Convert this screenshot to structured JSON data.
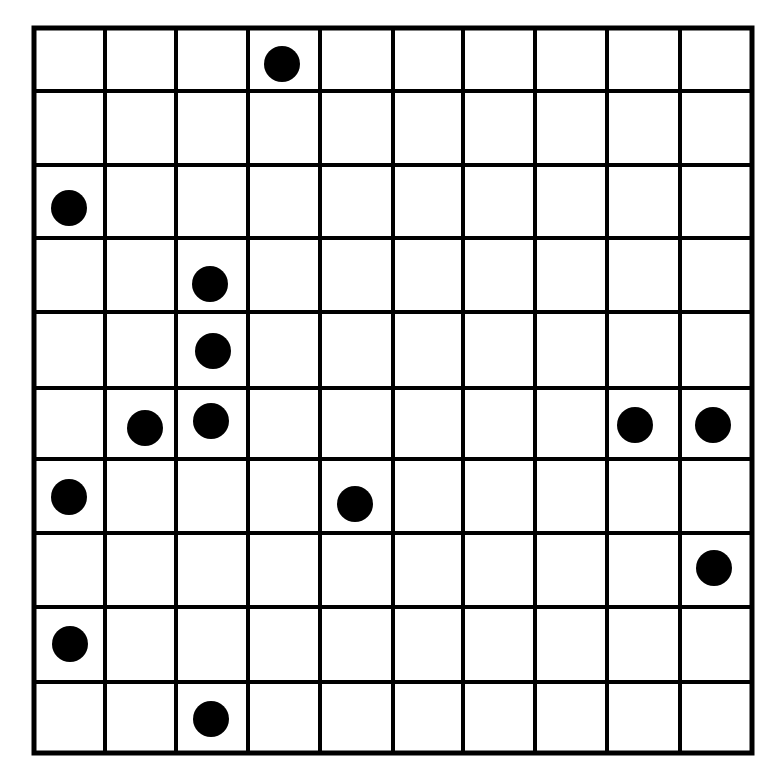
{
  "grid": {
    "rows": 10,
    "cols": 10,
    "x_lines": [
      34,
      105,
      176,
      248,
      320,
      393,
      463,
      535,
      607,
      680,
      752
    ],
    "y_lines": [
      28,
      91,
      165,
      238,
      312,
      388,
      459,
      533,
      607,
      682,
      753
    ],
    "line_color": "#000000",
    "background": "#ffffff",
    "line_width": 4,
    "outer_width": 5
  },
  "dots": {
    "color": "#000000",
    "radius": 18,
    "items": [
      {
        "row": 0,
        "col": 3,
        "x": 282,
        "y": 64
      },
      {
        "row": 2,
        "col": 0,
        "x": 69,
        "y": 208
      },
      {
        "row": 3,
        "col": 2,
        "x": 210,
        "y": 284
      },
      {
        "row": 4,
        "col": 2,
        "x": 213,
        "y": 351
      },
      {
        "row": 5,
        "col": 1,
        "x": 145,
        "y": 428
      },
      {
        "row": 5,
        "col": 2,
        "x": 211,
        "y": 421
      },
      {
        "row": 5,
        "col": 8,
        "x": 635,
        "y": 425
      },
      {
        "row": 5,
        "col": 9,
        "x": 713,
        "y": 425
      },
      {
        "row": 6,
        "col": 0,
        "x": 69,
        "y": 497
      },
      {
        "row": 6,
        "col": 4,
        "x": 355,
        "y": 504
      },
      {
        "row": 7,
        "col": 9,
        "x": 714,
        "y": 568
      },
      {
        "row": 8,
        "col": 0,
        "x": 70,
        "y": 644
      },
      {
        "row": 9,
        "col": 2,
        "x": 211,
        "y": 719
      }
    ]
  }
}
